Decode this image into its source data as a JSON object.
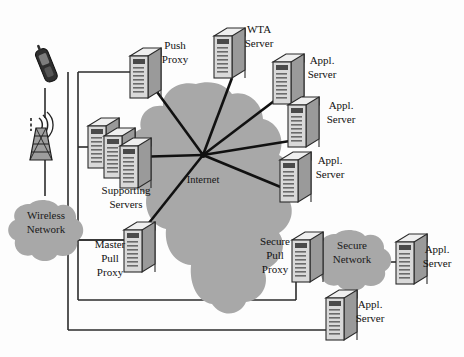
{
  "diagram": {
    "background_color": "#fdfdfd",
    "cloud_color": "#a8a8a8",
    "line_color": "#2b2b2b",
    "server_body_color": "#d9d9d9",
    "server_top_color": "#efefef",
    "server_side_color": "#8f8f8f"
  },
  "clouds": [
    {
      "id": "wireless-network",
      "name": "wireless-network-cloud",
      "line1": "Wireless",
      "line2": "Network",
      "cx": 46,
      "cy": 222
    },
    {
      "id": "internet",
      "name": "internet-cloud",
      "line1": "Internet",
      "line2": "",
      "cx": 203,
      "cy": 180
    },
    {
      "id": "secure-network",
      "name": "secure-network-cloud",
      "line1": "Secure",
      "line2": "Network",
      "cx": 352,
      "cy": 252
    }
  ],
  "nodes": [
    {
      "id": "push-proxy",
      "name": "push-proxy-server",
      "line1": "Push",
      "line2": "Proxy",
      "icon": "server-icon",
      "x": 130,
      "y": 48,
      "label_x": 175,
      "label_y": 52
    },
    {
      "id": "wta-server",
      "name": "wta-server",
      "line1": "WTA",
      "line2": "Server",
      "icon": "server-icon",
      "x": 231,
      "y": 28,
      "label_x": 258,
      "label_y": 36
    },
    {
      "id": "appl-server-1",
      "name": "appl-server-top",
      "line1": "Appl.",
      "line2": "Server",
      "icon": "server-icon",
      "x": 287,
      "y": 54,
      "label_x": 322,
      "label_y": 68
    },
    {
      "id": "appl-server-2",
      "name": "appl-server-middle",
      "line1": "Appl.",
      "line2": "Server",
      "icon": "server-icon",
      "x": 300,
      "y": 97,
      "label_x": 340,
      "label_y": 113
    },
    {
      "id": "appl-server-3",
      "name": "appl-server-lower",
      "line1": "Appl.",
      "line2": "Server",
      "icon": "server-icon",
      "x": 288,
      "y": 152,
      "label_x": 328,
      "label_y": 167
    },
    {
      "id": "supporting-servers",
      "name": "supporting-servers-cluster",
      "line1": "Supporting",
      "line2": "Servers",
      "icon": "server-stack-icon",
      "x": 97,
      "y": 120,
      "label_x": 124,
      "label_y": 192
    },
    {
      "id": "master-pull-proxy",
      "name": "master-pull-proxy-server",
      "line1": "Master",
      "line2": "Pull",
      "line3": "Proxy",
      "icon": "server-icon",
      "x": 128,
      "y": 228,
      "label_x": 110,
      "label_y": 258
    },
    {
      "id": "secure-pull-proxy",
      "name": "secure-pull-proxy-server",
      "line1": "Secure",
      "line2": "Pull",
      "line3": "Proxy",
      "icon": "server-icon",
      "x": 296,
      "y": 238,
      "label_x": 277,
      "label_y": 262
    },
    {
      "id": "appl-server-secure",
      "name": "appl-server-secure-network",
      "line1": "Appl.",
      "line2": "Server",
      "icon": "server-icon",
      "x": 398,
      "y": 240,
      "label_x": 436,
      "label_y": 258
    },
    {
      "id": "appl-server-bottom",
      "name": "appl-server-bottom",
      "line1": "Appl.",
      "line2": "Server",
      "icon": "server-icon",
      "x": 330,
      "y": 296,
      "label_x": 369,
      "label_y": 312
    }
  ],
  "devices": [
    {
      "id": "mobile-phone",
      "name": "mobile-phone-icon",
      "x": 44,
      "y": 60
    },
    {
      "id": "cell-tower",
      "name": "cell-tower-icon",
      "x": 42,
      "y": 128
    }
  ],
  "hub": {
    "name": "internet-hub-point",
    "x": 203,
    "y": 155
  },
  "spokes": [
    {
      "name": "spoke-to-push-proxy",
      "x2": 152,
      "y2": 85
    },
    {
      "name": "spoke-to-wta-server",
      "x2": 232,
      "y2": 78
    },
    {
      "name": "spoke-to-appl-server-1",
      "x2": 282,
      "y2": 95
    },
    {
      "name": "spoke-to-appl-server-2",
      "x2": 296,
      "y2": 140
    },
    {
      "name": "spoke-to-appl-server-3",
      "x2": 283,
      "y2": 188
    },
    {
      "name": "spoke-to-supporting-servers",
      "x2": 133,
      "y2": 157
    },
    {
      "name": "spoke-to-master-pull-proxy",
      "x2": 141,
      "y2": 233
    }
  ]
}
